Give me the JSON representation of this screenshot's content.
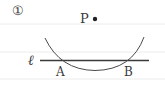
{
  "figure": {
    "number_label": "①",
    "point_label": "P",
    "line_label": "ℓ",
    "intersection_labels": [
      "A",
      "B"
    ]
  },
  "colors": {
    "stroke": "#3a3a3a",
    "rule_lines": "#e6e6e6",
    "background": "#ffffff"
  }
}
